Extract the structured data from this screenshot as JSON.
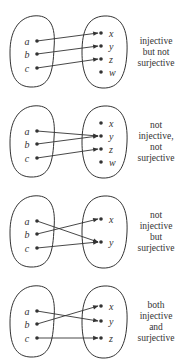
{
  "panels": [
    {
      "caption": [
        "injective",
        "but not",
        "surjective"
      ],
      "domain": [
        "a",
        "b",
        "c"
      ],
      "codomain": [
        "x",
        "y",
        "z",
        "w"
      ],
      "mapping": {
        "a": "x",
        "b": "y",
        "c": "z"
      }
    },
    {
      "caption": [
        "not",
        "injective,",
        "not",
        "surjective"
      ],
      "domain": [
        "a",
        "b",
        "c"
      ],
      "codomain": [
        "x",
        "y",
        "z",
        "w"
      ],
      "mapping": {
        "a": "y",
        "b": "y",
        "c": "z"
      }
    },
    {
      "caption": [
        "not",
        "injective",
        "but",
        "surjective"
      ],
      "domain": [
        "a",
        "b",
        "c"
      ],
      "codomain": [
        "x",
        "y"
      ],
      "mapping": {
        "a": "y",
        "b": "x",
        "c": "y"
      }
    },
    {
      "caption": [
        "both",
        "injective",
        "and",
        "surjective"
      ],
      "domain": [
        "a",
        "b",
        "c"
      ],
      "codomain": [
        "x",
        "y",
        "z"
      ],
      "mapping": {
        "a": "y",
        "b": "x",
        "c": "z"
      }
    }
  ],
  "colors": {
    "stroke": "#333333",
    "background": "#ffffff"
  }
}
